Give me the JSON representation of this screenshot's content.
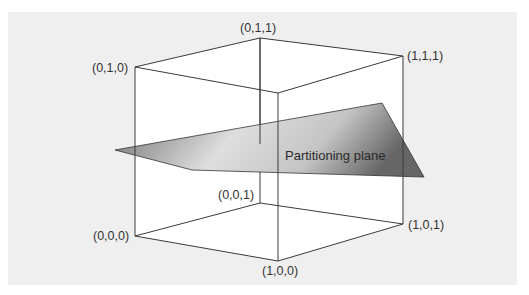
{
  "diagram": {
    "vertices": [
      {
        "id": "v010",
        "label": "(0,1,0)"
      },
      {
        "id": "v011",
        "label": "(0,1,1)"
      },
      {
        "id": "v111",
        "label": "(1,1,1)"
      },
      {
        "id": "v110",
        "label": ""
      },
      {
        "id": "v000",
        "label": "(0,0,0)"
      },
      {
        "id": "v001",
        "label": "(0,0,1)"
      },
      {
        "id": "v101",
        "label": "(1,0,1)"
      },
      {
        "id": "v100",
        "label": "(1,0,0)"
      }
    ],
    "plane_label": "Partitioning plane",
    "colors": {
      "background": "#efefef",
      "cube_face": "#ffffff",
      "edge": "#3a3a3a",
      "plane_light": "#e8e8e8",
      "plane_dark": "#6f6f6f"
    }
  }
}
